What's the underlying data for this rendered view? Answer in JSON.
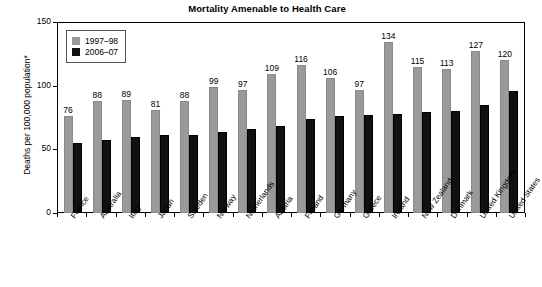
{
  "chart_data": {
    "type": "bar",
    "title": "Mortality Amenable to Health Care",
    "xlabel": "",
    "ylabel": "Deaths per 100,000 population*",
    "ylim": [
      0,
      150
    ],
    "yticks": [
      0,
      50,
      100,
      150
    ],
    "grid": false,
    "legend_position": "top-left",
    "categories": [
      "France",
      "Australia",
      "Italy",
      "Japan",
      "Sweden",
      "Norway",
      "Netherlands",
      "Austria",
      "Finland",
      "Germany",
      "Greece",
      "Ireland",
      "New Zealand",
      "Denmark",
      "United Kingdom",
      "United States"
    ],
    "series": [
      {
        "name": "1997–98",
        "color": "#9a9a9a",
        "labels_shown": true,
        "values": [
          76,
          88,
          89,
          81,
          88,
          99,
          97,
          109,
          116,
          106,
          97,
          134,
          115,
          113,
          127,
          120
        ]
      },
      {
        "name": "2006–07",
        "color": "#111111",
        "labels_shown": false,
        "values": [
          55,
          57,
          60,
          61,
          61,
          64,
          66,
          68,
          74,
          76,
          77,
          78,
          79,
          80,
          85,
          96
        ]
      }
    ]
  },
  "legend": {
    "items": [
      {
        "label": "1997–98"
      },
      {
        "label": "2006–07"
      }
    ]
  }
}
